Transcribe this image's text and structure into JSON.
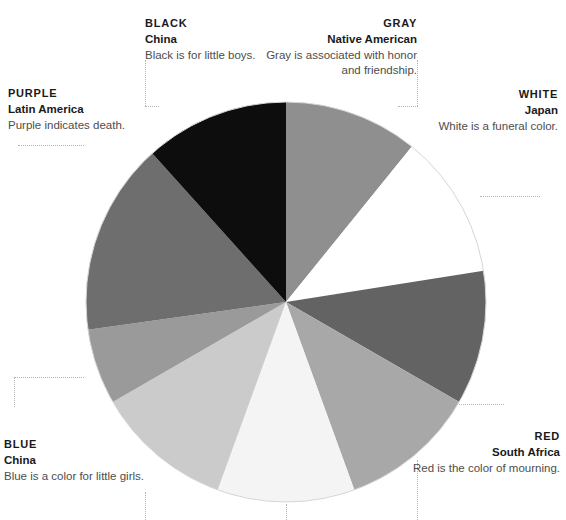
{
  "figure": {
    "background": "#ffffff",
    "leader_line_color": "#b4b4b4"
  },
  "chart_data": {
    "type": "pie",
    "title": "",
    "subtitle": "",
    "xlabel": "",
    "ylabel": "",
    "legend_position": "callouts-around-pie",
    "grid": false,
    "center": {
      "x": 286,
      "y": 302
    },
    "radius": 201,
    "start_angle_deg": 0,
    "direction": "clockwise",
    "categories": [
      "GRAY",
      "WHITE",
      "RED",
      "slice-4",
      "slice-5",
      "BLUE",
      "slice-7",
      "PURPLE",
      "BLACK"
    ],
    "values": [
      10.8,
      11.7,
      10.8,
      11.1,
      11.1,
      11.1,
      6.1,
      15.6,
      11.7
    ],
    "slices": [
      {
        "name": "gray-slice",
        "label": "GRAY",
        "start_deg": 0,
        "end_deg": 39,
        "color": "#8f8f8f",
        "share_pct": 10.8
      },
      {
        "name": "white-slice",
        "label": "WHITE",
        "start_deg": 39,
        "end_deg": 81,
        "color": "#ffffff",
        "share_pct": 11.7
      },
      {
        "name": "red-slice",
        "label": "RED",
        "start_deg": 81,
        "end_deg": 120,
        "color": "#636363",
        "share_pct": 10.8
      },
      {
        "name": "unlabeled-slice-4",
        "label": "",
        "start_deg": 120,
        "end_deg": 160,
        "color": "#a8a8a8",
        "share_pct": 11.1
      },
      {
        "name": "unlabeled-slice-5",
        "label": "",
        "start_deg": 160,
        "end_deg": 200,
        "color": "#f4f4f4",
        "share_pct": 11.1
      },
      {
        "name": "blue-slice",
        "label": "BLUE",
        "start_deg": 200,
        "end_deg": 240,
        "color": "#cbcbcb",
        "share_pct": 11.1
      },
      {
        "name": "unlabeled-slice-7",
        "label": "",
        "start_deg": 240,
        "end_deg": 262,
        "color": "#9a9a9a",
        "share_pct": 6.1
      },
      {
        "name": "purple-slice",
        "label": "PURPLE",
        "start_deg": 262,
        "end_deg": 318,
        "color": "#6e6e6e",
        "share_pct": 15.6
      },
      {
        "name": "black-slice",
        "label": "BLACK",
        "start_deg": 318,
        "end_deg": 360,
        "color": "#0d0d0d",
        "share_pct": 11.7
      }
    ]
  },
  "callouts": {
    "black": {
      "color_name": "BLACK",
      "place": "China",
      "description": "Black is for little boys."
    },
    "gray": {
      "color_name": "GRAY",
      "place": "Native American",
      "description": "Gray is associated with honor and friendship."
    },
    "white": {
      "color_name": "WHITE",
      "place": "Japan",
      "description": "White is a funeral color."
    },
    "purple": {
      "color_name": "PURPLE",
      "place": "Latin America",
      "description": "Purple indicates death."
    },
    "blue": {
      "color_name": "BLUE",
      "place": "China",
      "description": "Blue is a color for little girls."
    },
    "red": {
      "color_name": "RED",
      "place": "South Africa",
      "description": "Red is the color of mourning."
    }
  }
}
